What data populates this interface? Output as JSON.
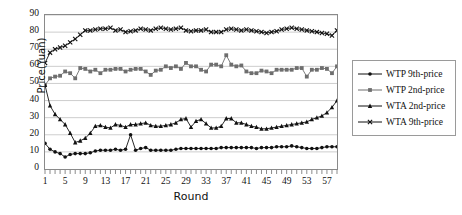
{
  "chart_data": {
    "type": "line",
    "title": "",
    "xlabel": "Round",
    "ylabel": "Price(Yuan)",
    "xlim": [
      1,
      59
    ],
    "ylim": [
      0,
      90
    ],
    "ytick_step": 10,
    "xtick_step": 4,
    "grid": true,
    "legend_position": "right",
    "yticks": [
      "0",
      "10",
      "20",
      "30",
      "40",
      "50",
      "60",
      "70",
      "80",
      "90"
    ],
    "xticks": [
      "1",
      "5",
      "9",
      "13",
      "17",
      "21",
      "25",
      "29",
      "33",
      "37",
      "41",
      "45",
      "49",
      "53",
      "57"
    ],
    "x": [
      1,
      2,
      3,
      4,
      5,
      6,
      7,
      8,
      9,
      10,
      11,
      12,
      13,
      14,
      15,
      16,
      17,
      18,
      19,
      20,
      21,
      22,
      23,
      24,
      25,
      26,
      27,
      28,
      29,
      30,
      31,
      32,
      33,
      34,
      35,
      36,
      37,
      38,
      39,
      40,
      41,
      42,
      43,
      44,
      45,
      46,
      47,
      48,
      49,
      50,
      51,
      52,
      53,
      54,
      55,
      56,
      57,
      58,
      59
    ],
    "series": [
      {
        "name": "WTP 9th-price",
        "marker": "diamond",
        "color": "#111111",
        "values": [
          15,
          11.5,
          10,
          9,
          7,
          8.5,
          9,
          9,
          9,
          9.5,
          10.5,
          11,
          11,
          11,
          11.5,
          11,
          11.5,
          20,
          11,
          12,
          12.5,
          11,
          11,
          11,
          11,
          11,
          11.5,
          12,
          12,
          12,
          12,
          12,
          12,
          12,
          12,
          12.5,
          12.5,
          12.5,
          12.5,
          12.5,
          12.5,
          12.5,
          12,
          12.5,
          12.5,
          12.5,
          13,
          13,
          13,
          13.5,
          13,
          12.5,
          12,
          12,
          12,
          12.5,
          13,
          13,
          13
        ]
      },
      {
        "name": "WTP 2nd-price",
        "marker": "square",
        "color": "#6e6e6e",
        "values": [
          49,
          53,
          54,
          54.5,
          57,
          56,
          53,
          59,
          58.5,
          57,
          58,
          56,
          58,
          58,
          58.5,
          58.5,
          57,
          58,
          58.5,
          58.5,
          57,
          55,
          57.5,
          58,
          60,
          59,
          60,
          58.5,
          62,
          60,
          60,
          58,
          57,
          61,
          61,
          60,
          66.5,
          61,
          60,
          60.5,
          57,
          56,
          56,
          57.5,
          57,
          56,
          58,
          58,
          58,
          58,
          59,
          59,
          54,
          58,
          58,
          59,
          58.5,
          56,
          60
        ]
      },
      {
        "name": "WTA 2nd-price",
        "marker": "triangle",
        "color": "#111111",
        "values": [
          49,
          37,
          32,
          29,
          26,
          21,
          15.5,
          16.5,
          18,
          21,
          25,
          25.5,
          24.5,
          24,
          26,
          25.5,
          24.5,
          26,
          26,
          26.5,
          27,
          25.5,
          25,
          25,
          25.5,
          26,
          27,
          29,
          29.5,
          24.5,
          28,
          29,
          26.5,
          24,
          24,
          25,
          29.5,
          29.5,
          27,
          27,
          26,
          25,
          24.5,
          23.5,
          23.5,
          24,
          24.5,
          25,
          25.5,
          26,
          26.5,
          27,
          27.5,
          29,
          30,
          31,
          33,
          36,
          40
        ]
      },
      {
        "name": "WTA 9th-price",
        "marker": "cross",
        "color": "#111111",
        "values": [
          62,
          68,
          70,
          71,
          72,
          74,
          76,
          78.5,
          81,
          81,
          81.5,
          82,
          82,
          82.5,
          81,
          81.5,
          80,
          80.5,
          81,
          82,
          81.5,
          81,
          82,
          82.5,
          82,
          81.5,
          82,
          82.5,
          81,
          80.5,
          81,
          81,
          81.5,
          80,
          80,
          80,
          81.5,
          82,
          81.5,
          81,
          81.5,
          81,
          80.5,
          80,
          79.5,
          80,
          80.5,
          81.5,
          82,
          82.5,
          82,
          81.5,
          81,
          80.5,
          80,
          79.5,
          79,
          78,
          81
        ]
      }
    ]
  },
  "legend": {
    "items": [
      {
        "label": "WTP 9th-price"
      },
      {
        "label": "WTP 2nd-price"
      },
      {
        "label": "WTA 2nd-price"
      },
      {
        "label": "WTA 9th-price"
      }
    ]
  }
}
